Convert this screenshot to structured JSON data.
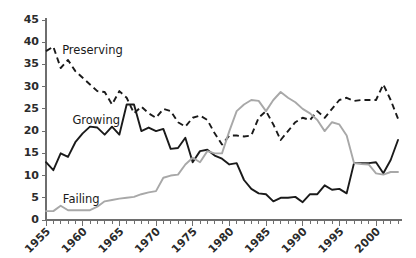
{
  "chart_data": {
    "type": "line",
    "title": "",
    "subtitle": "",
    "xlabel": "",
    "ylabel": "",
    "xlim": [
      1955,
      2003
    ],
    "ylim": [
      0,
      45
    ],
    "ytick_step": 5,
    "grid": false,
    "legend_position": "inline-annotations",
    "x": [
      1955,
      1956,
      1957,
      1958,
      1959,
      1960,
      1961,
      1962,
      1963,
      1964,
      1965,
      1966,
      1967,
      1968,
      1969,
      1970,
      1971,
      1972,
      1973,
      1974,
      1975,
      1976,
      1977,
      1978,
      1979,
      1980,
      1981,
      1982,
      1983,
      1984,
      1985,
      1986,
      1987,
      1988,
      1989,
      1990,
      1991,
      1992,
      1993,
      1994,
      1995,
      1996,
      1997,
      1998,
      1999,
      2000,
      2001,
      2002,
      2003
    ],
    "xtick_labels": [
      "1955",
      "1960",
      "1965",
      "1970",
      "1975",
      "1980",
      "1985",
      "1990",
      "1995",
      "2000"
    ],
    "xtick_values": [
      1955,
      1960,
      1965,
      1970,
      1975,
      1980,
      1985,
      1990,
      1995,
      2000
    ],
    "ytick_labels": [
      "0",
      "5",
      "10",
      "15",
      "20",
      "25",
      "30",
      "35",
      "40",
      "45"
    ],
    "ytick_values": [
      0,
      5,
      10,
      15,
      20,
      25,
      30,
      35,
      40,
      45
    ],
    "series": [
      {
        "name": "Preserving",
        "color": "#1a1a1a",
        "style": "dashed",
        "label_x": 1957.2,
        "label_y": 38.2,
        "values": [
          38.0,
          39.0,
          34.2,
          36.0,
          33.5,
          32.0,
          30.5,
          29.0,
          28.8,
          26.0,
          29.0,
          27.5,
          24.0,
          25.5,
          24.0,
          23.0,
          25.0,
          24.5,
          22.0,
          21.0,
          23.0,
          23.5,
          22.5,
          19.5,
          17.0,
          19.0,
          19.0,
          18.8,
          19.0,
          23.0,
          24.5,
          21.5,
          18.0,
          20.0,
          22.0,
          23.0,
          22.5,
          24.5,
          23.0,
          25.0,
          27.0,
          27.5,
          26.8,
          27.0,
          27.0,
          27.0,
          30.5,
          27.0,
          22.8
        ]
      },
      {
        "name": "Growing",
        "color": "#1a1a1a",
        "style": "solid",
        "label_x": 1958.6,
        "label_y": 22.5,
        "values": [
          13.0,
          11.2,
          15.0,
          14.2,
          17.5,
          19.5,
          21.0,
          20.8,
          19.2,
          21.0,
          19.2,
          26.0,
          26.0,
          20.0,
          20.8,
          20.0,
          20.5,
          16.0,
          16.2,
          18.5,
          13.0,
          15.5,
          15.8,
          14.5,
          13.8,
          12.5,
          12.8,
          9.0,
          7.0,
          6.0,
          5.8,
          4.2,
          5.0,
          5.0,
          5.2,
          4.0,
          5.8,
          5.8,
          7.8,
          6.8,
          7.0,
          6.0,
          12.8,
          12.8,
          12.8,
          13.0,
          10.5,
          13.5,
          18.0
        ]
      },
      {
        "name": "Failing",
        "color": "#a8a8a8",
        "style": "solid",
        "label_x": 1957.3,
        "label_y": 4.6,
        "values": [
          2.0,
          2.0,
          3.2,
          2.2,
          2.2,
          2.2,
          2.2,
          3.0,
          4.2,
          4.5,
          4.8,
          5.0,
          5.2,
          5.8,
          6.2,
          6.5,
          9.5,
          10.0,
          10.2,
          12.5,
          14.0,
          13.0,
          15.5,
          15.0,
          15.0,
          20.0,
          24.5,
          26.0,
          27.0,
          26.8,
          24.5,
          27.0,
          28.8,
          27.5,
          26.5,
          25.0,
          24.0,
          22.5,
          20.0,
          22.0,
          21.5,
          19.0,
          12.8,
          12.6,
          12.5,
          10.5,
          10.2,
          10.8,
          10.8
        ]
      }
    ]
  }
}
